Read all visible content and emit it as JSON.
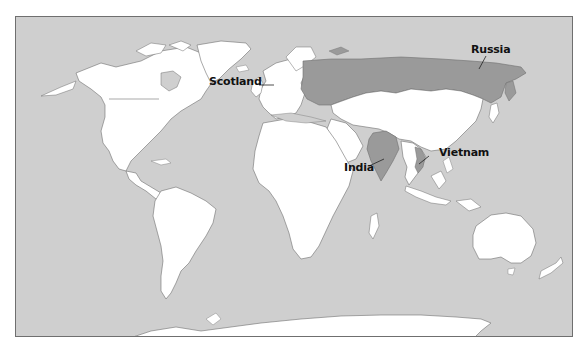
{
  "map": {
    "type": "world political outline map",
    "colors": {
      "ocean": "#cfcfcf",
      "land": "#ffffff",
      "highlighted": "#9a9a9a",
      "border": "#6f6f6f",
      "frame": "#6f6f6f",
      "label": "#111111"
    },
    "labels": [
      {
        "id": "russia",
        "text": "Russia"
      },
      {
        "id": "scotland",
        "text": "Scotland"
      },
      {
        "id": "india",
        "text": "India"
      },
      {
        "id": "vietnam",
        "text": "Vietnam"
      }
    ],
    "highlighted_countries": [
      "Russia",
      "India",
      "Vietnam"
    ]
  }
}
